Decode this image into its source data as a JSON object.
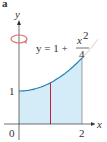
{
  "figure": {
    "corner_label": "a",
    "axis_x_label": "x",
    "axis_y_label": "y",
    "origin_label": "0",
    "tick_x_label": "2",
    "tick_y_label": "1",
    "equation": {
      "lhs": "y = 1 +",
      "numerator": "x",
      "exponent": "2",
      "denominator": "4"
    },
    "rotation_icon": "rotation-arrow-icon",
    "colors": {
      "curve": "#1f7fb5",
      "fill": "#d3ecf8",
      "slice_line": "#c0203a",
      "rotation_arrow": "#e06a6a",
      "axis": "#333333"
    }
  },
  "chart_data": {
    "type": "area",
    "function": "y = 1 + x^2/4",
    "x": [
      0,
      0.25,
      0.5,
      0.75,
      1,
      1.25,
      1.5,
      1.75,
      2
    ],
    "y": [
      1,
      1.0156,
      1.0625,
      1.1406,
      1.25,
      1.3906,
      1.5625,
      1.7656,
      2
    ],
    "shaded_region": {
      "x_from": 0,
      "x_to": 2
    },
    "slice_x": 1,
    "axis_of_rotation": "y-axis",
    "xlim": [
      0,
      2
    ],
    "ylim": [
      0,
      2
    ],
    "xticks": [
      "0",
      "2"
    ],
    "yticks": [
      "1"
    ]
  }
}
